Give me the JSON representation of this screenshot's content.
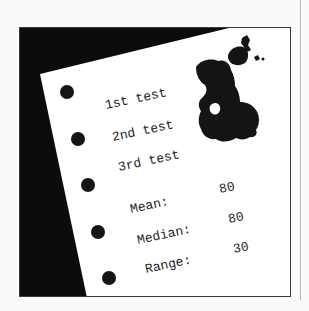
{
  "illustration": {
    "description": "Sheet of loose-leaf paper on a black background with an ink blot",
    "colors": {
      "page_background": "#fafafa",
      "frame_border": "#3a3a3a",
      "backdrop": "#0c0c0c",
      "paper": "#ffffff",
      "ink": "#141414",
      "text": "#1e1e1e",
      "side_rule": "#b8b8b8"
    },
    "paper": {
      "holes_count": 5,
      "tests": [
        {
          "label": "1st test"
        },
        {
          "label": "2nd test"
        },
        {
          "label": "3rd test"
        }
      ],
      "stats": [
        {
          "label": "Mean:",
          "value": "80"
        },
        {
          "label": "Median:",
          "value": "80"
        },
        {
          "label": "Range:",
          "value": "30"
        }
      ],
      "ink_blot": "ink-blot-icon"
    }
  }
}
